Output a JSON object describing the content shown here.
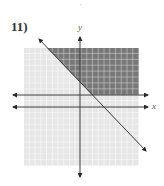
{
  "problem": {
    "number_label": "11)",
    "top_mark": ","
  },
  "axes": {
    "x_label": "x",
    "y_label": "y"
  },
  "colors": {
    "shaded": "#787878",
    "unshaded": "#e6e6e6",
    "gridline": "#ffffff",
    "line": "#3a3a3a"
  },
  "graph": {
    "grid_range": {
      "xmin": -10,
      "xmax": 10,
      "ymin": -10,
      "ymax": 10
    },
    "boundary_lines": [
      {
        "equation": "y = 2",
        "style": "solid"
      },
      {
        "equation": "y = -x + 4",
        "style": "solid"
      }
    ],
    "shaded_region": "y > 2 and y > -x + 4"
  }
}
